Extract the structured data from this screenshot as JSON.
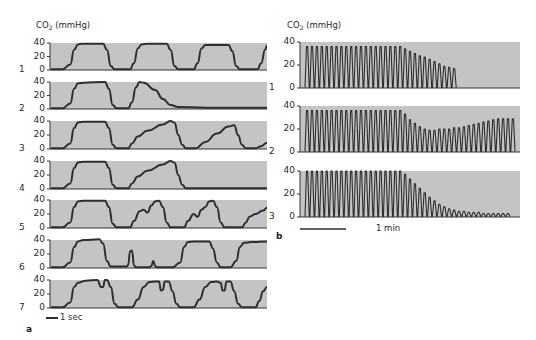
{
  "figure": {
    "panel_a": {
      "label": "a",
      "ylabel": "CO",
      "ylabel_sub": "2",
      "ylabel_unit": " (mmHg)",
      "scale_bar": "1 sec",
      "yticks": [
        "40",
        "20",
        "0"
      ]
    },
    "panel_b": {
      "label": "b",
      "ylabel": "CO",
      "ylabel_sub": "2",
      "ylabel_unit": " (mmHg)",
      "scale_bar": "1 min",
      "yticks": [
        "40",
        "20",
        "0"
      ]
    },
    "colors": {
      "plot_bg": "#c4c4c4",
      "trace": "#2e2e2e",
      "axis": "#333333"
    }
  },
  "chart_data": [
    {
      "type": "line",
      "title": "a",
      "ylabel": "CO2 (mmHg)",
      "xlabel": "time (scale bar: 1 sec)",
      "ylim": [
        0,
        40
      ],
      "yticks": [
        0,
        20,
        40
      ],
      "series": [
        {
          "name": "1",
          "description": "normal capnogram, square plateaus ~38-40 mmHg",
          "points": [
            [
              0,
              1
            ],
            [
              6,
              1
            ],
            [
              10,
              8
            ],
            [
              12,
              30
            ],
            [
              14,
              38
            ],
            [
              16,
              39
            ],
            [
              27,
              39
            ],
            [
              29,
              30
            ],
            [
              31,
              6
            ],
            [
              33,
              1
            ],
            [
              41,
              1
            ],
            [
              43,
              10
            ],
            [
              45,
              32
            ],
            [
              47,
              38
            ],
            [
              50,
              39
            ],
            [
              60,
              39
            ],
            [
              62,
              30
            ],
            [
              64,
              6
            ],
            [
              66,
              1
            ],
            [
              74,
              1
            ],
            [
              76,
              10
            ],
            [
              78,
              32
            ],
            [
              80,
              37
            ],
            [
              92,
              37
            ],
            [
              94,
              28
            ],
            [
              96,
              6
            ],
            [
              98,
              1
            ],
            [
              107,
              1
            ],
            [
              109,
              10
            ],
            [
              111,
              30
            ],
            [
              112,
              36
            ]
          ]
        },
        {
          "name": "2",
          "description": "one normal breath then single peak with slow decay to ~0 (apnea/disconnect)",
          "points": [
            [
              0,
              1
            ],
            [
              6,
              1
            ],
            [
              10,
              8
            ],
            [
              12,
              30
            ],
            [
              14,
              38
            ],
            [
              17,
              39
            ],
            [
              28,
              40
            ],
            [
              30,
              30
            ],
            [
              32,
              6
            ],
            [
              34,
              1
            ],
            [
              40,
              1
            ],
            [
              42,
              10
            ],
            [
              44,
              32
            ],
            [
              46,
              40
            ],
            [
              48,
              39
            ],
            [
              54,
              28
            ],
            [
              58,
              15
            ],
            [
              62,
              6
            ],
            [
              66,
              3
            ],
            [
              80,
              2
            ],
            [
              112,
              2
            ]
          ]
        },
        {
          "name": "3",
          "description": "normal breath then sloped (obstructive) upslope waveforms",
          "points": [
            [
              0,
              1
            ],
            [
              6,
              1
            ],
            [
              10,
              8
            ],
            [
              12,
              30
            ],
            [
              14,
              38
            ],
            [
              17,
              39
            ],
            [
              28,
              39
            ],
            [
              30,
              30
            ],
            [
              32,
              6
            ],
            [
              34,
              1
            ],
            [
              40,
              1
            ],
            [
              42,
              8
            ],
            [
              45,
              18
            ],
            [
              50,
              26
            ],
            [
              58,
              35
            ],
            [
              62,
              40
            ],
            [
              64,
              38
            ],
            [
              66,
              20
            ],
            [
              68,
              6
            ],
            [
              70,
              1
            ],
            [
              75,
              1
            ],
            [
              80,
              10
            ],
            [
              86,
              22
            ],
            [
              92,
              32
            ],
            [
              95,
              34
            ],
            [
              97,
              20
            ],
            [
              99,
              6
            ],
            [
              101,
              1
            ],
            [
              106,
              1
            ],
            [
              109,
              4
            ],
            [
              112,
              9
            ]
          ]
        },
        {
          "name": "4",
          "description": "normal breath, one sloped breath, then flat ~0",
          "points": [
            [
              0,
              1
            ],
            [
              6,
              1
            ],
            [
              10,
              8
            ],
            [
              12,
              30
            ],
            [
              14,
              38
            ],
            [
              17,
              39
            ],
            [
              28,
              39
            ],
            [
              30,
              30
            ],
            [
              32,
              6
            ],
            [
              34,
              1
            ],
            [
              40,
              1
            ],
            [
              42,
              8
            ],
            [
              45,
              18
            ],
            [
              50,
              26
            ],
            [
              58,
              35
            ],
            [
              62,
              40
            ],
            [
              64,
              38
            ],
            [
              66,
              20
            ],
            [
              68,
              6
            ],
            [
              70,
              1
            ],
            [
              80,
              1
            ],
            [
              112,
              1
            ]
          ]
        },
        {
          "name": "5",
          "description": "normal breath then irregular curare-cleft / bumpy plateaus",
          "points": [
            [
              0,
              1
            ],
            [
              6,
              1
            ],
            [
              10,
              8
            ],
            [
              12,
              30
            ],
            [
              14,
              38
            ],
            [
              17,
              39
            ],
            [
              28,
              39
            ],
            [
              30,
              30
            ],
            [
              32,
              6
            ],
            [
              34,
              1
            ],
            [
              41,
              1
            ],
            [
              43,
              10
            ],
            [
              46,
              24
            ],
            [
              48,
              26
            ],
            [
              50,
              22
            ],
            [
              52,
              32
            ],
            [
              54,
              38
            ],
            [
              56,
              39
            ],
            [
              58,
              30
            ],
            [
              60,
              8
            ],
            [
              62,
              1
            ],
            [
              69,
              1
            ],
            [
              71,
              10
            ],
            [
              74,
              20
            ],
            [
              76,
              16
            ],
            [
              78,
              26
            ],
            [
              80,
              30
            ],
            [
              82,
              38
            ],
            [
              84,
              39
            ],
            [
              86,
              30
            ],
            [
              88,
              8
            ],
            [
              90,
              1
            ],
            [
              99,
              1
            ],
            [
              101,
              8
            ],
            [
              103,
              16
            ],
            [
              106,
              20
            ],
            [
              110,
              25
            ],
            [
              112,
              29
            ]
          ]
        },
        {
          "name": "6",
          "description": "normal breath, two small spikes (~25 and ~10), normal breaths",
          "points": [
            [
              0,
              1
            ],
            [
              6,
              1
            ],
            [
              10,
              8
            ],
            [
              12,
              30
            ],
            [
              14,
              38
            ],
            [
              17,
              40
            ],
            [
              25,
              41
            ],
            [
              27,
              35
            ],
            [
              29,
              10
            ],
            [
              31,
              2
            ],
            [
              39,
              2
            ],
            [
              40,
              4
            ],
            [
              41,
              24
            ],
            [
              42,
              25
            ],
            [
              43,
              4
            ],
            [
              44,
              1
            ],
            [
              51,
              1
            ],
            [
              52,
              3
            ],
            [
              53,
              10
            ],
            [
              54,
              3
            ],
            [
              55,
              1
            ],
            [
              63,
              1
            ],
            [
              67,
              8
            ],
            [
              69,
              30
            ],
            [
              71,
              37
            ],
            [
              74,
              38
            ],
            [
              82,
              38
            ],
            [
              84,
              28
            ],
            [
              86,
              8
            ],
            [
              88,
              1
            ],
            [
              93,
              1
            ],
            [
              96,
              10
            ],
            [
              98,
              30
            ],
            [
              100,
              36
            ],
            [
              104,
              37
            ],
            [
              112,
              38
            ]
          ]
        },
        {
          "name": "7",
          "description": "breaths with cleft (dip) in plateau",
          "points": [
            [
              0,
              1
            ],
            [
              6,
              1
            ],
            [
              10,
              8
            ],
            [
              12,
              30
            ],
            [
              14,
              36
            ],
            [
              18,
              39
            ],
            [
              24,
              40
            ],
            [
              26,
              30
            ],
            [
              27,
              30
            ],
            [
              28,
              40
            ],
            [
              29,
              40
            ],
            [
              31,
              30
            ],
            [
              33,
              6
            ],
            [
              35,
              1
            ],
            [
              42,
              1
            ],
            [
              45,
              12
            ],
            [
              48,
              30
            ],
            [
              51,
              37
            ],
            [
              54,
              38
            ],
            [
              56,
              38
            ],
            [
              57,
              25
            ],
            [
              58,
              26
            ],
            [
              59,
              38
            ],
            [
              61,
              38
            ],
            [
              63,
              24
            ],
            [
              65,
              6
            ],
            [
              67,
              1
            ],
            [
              74,
              1
            ],
            [
              77,
              12
            ],
            [
              80,
              30
            ],
            [
              83,
              37
            ],
            [
              86,
              38
            ],
            [
              88,
              36
            ],
            [
              89,
              25
            ],
            [
              90,
              25
            ],
            [
              91,
              38
            ],
            [
              93,
              38
            ],
            [
              95,
              24
            ],
            [
              97,
              6
            ],
            [
              99,
              1
            ],
            [
              106,
              1
            ],
            [
              108,
              10
            ],
            [
              110,
              24
            ],
            [
              112,
              30
            ]
          ]
        }
      ]
    },
    {
      "type": "line",
      "title": "b",
      "ylabel": "CO2 (mmHg)",
      "xlabel": "time (scale bar: 1 min)",
      "ylim": [
        0,
        40
      ],
      "yticks": [
        0,
        20,
        40
      ],
      "series": [
        {
          "name": "1",
          "description": "~20 breaths at ~36 mmHg, then ~10 breaths declining to ~17, then stop",
          "n_breaths": 30,
          "peaks": [
            36,
            36,
            36,
            36,
            36,
            36,
            36,
            36,
            36,
            36,
            36,
            36,
            36,
            36,
            36,
            36,
            36,
            36,
            36,
            36,
            34,
            32,
            30,
            28,
            27,
            25,
            23,
            21,
            19,
            18,
            17
          ]
        },
        {
          "name": "2",
          "description": "~20 breaths at ~36, dip to ~19, recovery to ~29, then stop",
          "n_breaths": 43,
          "peaks": [
            36,
            36,
            36,
            36,
            36,
            36,
            36,
            36,
            36,
            36,
            36,
            36,
            36,
            36,
            36,
            36,
            36,
            36,
            36,
            36,
            33,
            28,
            25,
            22,
            20,
            19,
            19,
            20,
            20,
            20,
            21,
            21,
            22,
            23,
            24,
            25,
            26,
            27,
            28,
            29,
            29,
            29,
            29
          ]
        },
        {
          "name": "3",
          "description": "~20 breaths at ~40, then exponential decline to ~3 oscillations",
          "n_breaths": 42,
          "peaks": [
            40,
            40,
            40,
            40,
            40,
            40,
            40,
            40,
            40,
            40,
            40,
            40,
            40,
            40,
            40,
            40,
            40,
            40,
            40,
            40,
            37,
            33,
            29,
            25,
            21,
            17,
            14,
            11,
            9,
            7,
            6,
            5,
            5,
            4,
            4,
            4,
            3,
            3,
            3,
            3,
            3,
            3
          ]
        }
      ]
    }
  ]
}
